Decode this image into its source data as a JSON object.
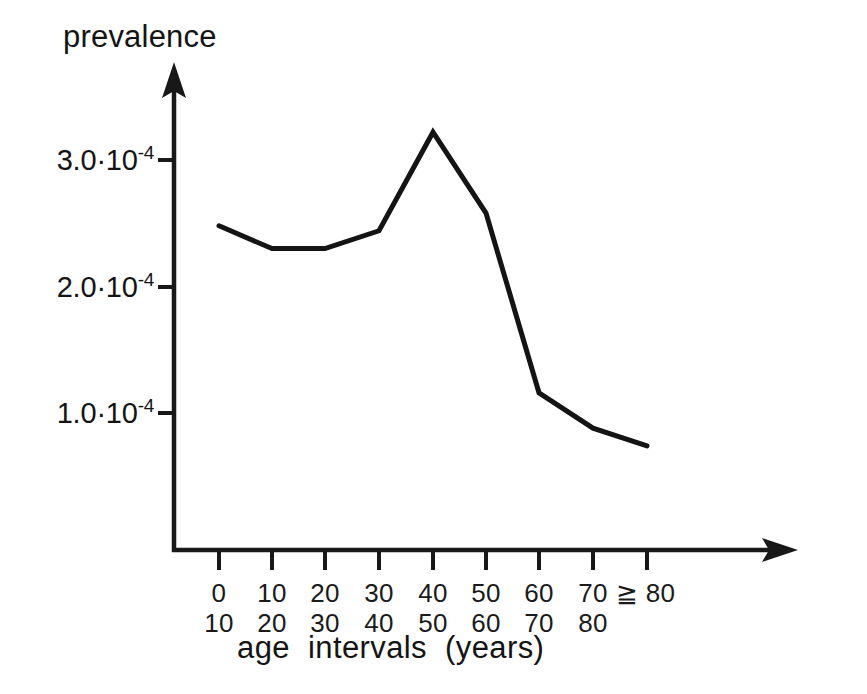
{
  "figure": {
    "background_color": "#ffffff",
    "ink_color": "#141414"
  },
  "axes": {
    "y_axis_title": "prevalence",
    "x_axis_title": "age  intervals  (years)",
    "y_tick_labels": [
      {
        "mantissa": "3.0·10",
        "exponent": "-4"
      },
      {
        "mantissa": "2.0·10",
        "exponent": "-4"
      },
      {
        "mantissa": "1.0·10",
        "exponent": "-4"
      }
    ],
    "x_tick_labels": [
      {
        "top": "0",
        "bottom": "10"
      },
      {
        "top": "10",
        "bottom": "20"
      },
      {
        "top": "20",
        "bottom": "30"
      },
      {
        "top": "30",
        "bottom": "40"
      },
      {
        "top": "40",
        "bottom": "50"
      },
      {
        "top": "50",
        "bottom": "60"
      },
      {
        "top": "60",
        "bottom": "70"
      },
      {
        "top": "70",
        "bottom": "80"
      },
      {
        "top": "≧ 80",
        "bottom": ""
      }
    ]
  },
  "chart_data": {
    "type": "line",
    "title": "",
    "xlabel": "age  intervals  (years)",
    "ylabel": "prevalence",
    "categories": [
      "0-10",
      "10-20",
      "20-30",
      "30-40",
      "40-50",
      "50-60",
      "60-70",
      "70-80",
      "≧ 80"
    ],
    "x_tick_top": [
      "0",
      "10",
      "20",
      "30",
      "40",
      "50",
      "60",
      "70",
      "≧ 80"
    ],
    "x_tick_bottom": [
      "10",
      "20",
      "30",
      "40",
      "50",
      "60",
      "70",
      "80",
      ""
    ],
    "values": [
      0.000248,
      0.00023,
      0.00023,
      0.000244,
      0.000322,
      0.000258,
      0.000116,
      8.8e-05,
      7.4e-05
    ],
    "values_scaled_1e4": [
      2.48,
      2.3,
      2.3,
      2.44,
      3.22,
      2.58,
      1.16,
      0.88,
      0.74
    ],
    "value_scale": "1e-4",
    "ytick_values_scaled_1e4": [
      3.0,
      2.0,
      1.0
    ],
    "ylim_scaled_1e4": [
      0,
      3.8
    ],
    "grid": false,
    "legend": false,
    "series": [
      {
        "name": "prevalence",
        "values_scaled_1e4": [
          2.48,
          2.3,
          2.3,
          2.44,
          3.22,
          2.58,
          1.16,
          0.88,
          0.74
        ]
      }
    ],
    "annotations": []
  }
}
